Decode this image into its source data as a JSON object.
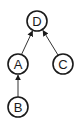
{
  "diagram": {
    "type": "directed-graph",
    "nodes": [
      {
        "id": "D",
        "label": "D",
        "x": 37,
        "y": 21
      },
      {
        "id": "A",
        "label": "A",
        "x": 18,
        "y": 64
      },
      {
        "id": "C",
        "label": "C",
        "x": 63,
        "y": 64
      },
      {
        "id": "B",
        "label": "B",
        "x": 18,
        "y": 107
      }
    ],
    "edges": [
      {
        "from": "A",
        "to": "D"
      },
      {
        "from": "C",
        "to": "D"
      },
      {
        "from": "B",
        "to": "A"
      }
    ],
    "node_radius": 10,
    "colors": {
      "stroke": "#1a1a1a",
      "background": "#ffffff"
    }
  }
}
